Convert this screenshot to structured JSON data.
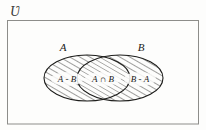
{
  "figure": {
    "type": "venn-diagram",
    "universe_symbol": "Ʋ",
    "sets": [
      {
        "id": "A",
        "label": "A"
      },
      {
        "id": "B",
        "label": "B"
      }
    ],
    "regions": [
      {
        "id": "a-minus-b",
        "label": "A - B",
        "shaded": true,
        "hatch": "diagonal-forward"
      },
      {
        "id": "a-intersect-b",
        "label": "A ∩ B",
        "shaded": true,
        "hatch": "diagonal-forward"
      },
      {
        "id": "b-minus-a",
        "label": "B - A",
        "shaded": true,
        "hatch": "diagonal-forward"
      }
    ],
    "colors": {
      "ink": "#1d1d1b",
      "frame": "#8d8d8a",
      "background": "#fdfdfc",
      "hatch": "#2a2a27"
    }
  }
}
